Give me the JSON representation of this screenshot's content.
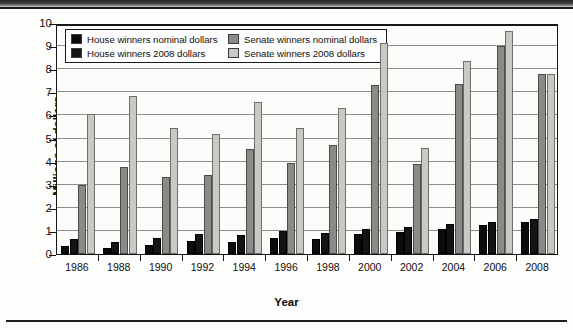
{
  "chart_data": {
    "type": "bar",
    "title": "",
    "xlabel": "Year",
    "ylabel": "Millions of dollars",
    "ylim": [
      0,
      10
    ],
    "ytick_step": 1,
    "yticks": [
      10,
      9,
      8,
      7,
      6,
      5,
      4,
      3,
      2,
      1,
      0
    ],
    "grid": true,
    "legend_position": "inside-top-left",
    "categories": [
      "1986",
      "1988",
      "1990",
      "1992",
      "1994",
      "1996",
      "1998",
      "2000",
      "2002",
      "2004",
      "2006",
      "2008"
    ],
    "series": [
      {
        "name": "House winners nominal dollars",
        "color": "#0c0c0c",
        "values": [
          0.33,
          0.28,
          0.41,
          0.55,
          0.53,
          0.68,
          0.65,
          0.85,
          0.95,
          1.1,
          1.25,
          1.4
        ]
      },
      {
        "name": "House winners 2008 dollars",
        "color": "#141414",
        "values": [
          0.65,
          0.5,
          0.7,
          0.88,
          0.82,
          0.98,
          0.9,
          1.08,
          1.15,
          1.28,
          1.4,
          1.5
        ]
      },
      {
        "name": "Senate winners nominal dollars",
        "color": "#8a8a87",
        "values": [
          3.0,
          3.75,
          3.35,
          3.4,
          4.55,
          3.95,
          4.7,
          7.3,
          3.9,
          7.35,
          9.0,
          7.8
        ]
      },
      {
        "name": "Senate winners 2008 dollars",
        "color": "#c8c8c4",
        "values": [
          6.05,
          6.85,
          5.45,
          5.2,
          6.6,
          5.45,
          6.3,
          9.15,
          4.6,
          8.35,
          9.65,
          7.8
        ]
      }
    ]
  },
  "legend": {
    "items": [
      {
        "label": "House winners nominal dollars",
        "swatch": "#0c0c0c"
      },
      {
        "label": "Senate winners nominal dollars",
        "swatch": "#8a8a87"
      },
      {
        "label": "House winners 2008 dollars",
        "swatch": "#141414"
      },
      {
        "label": "Senate winners 2008 dollars",
        "swatch": "#c8c8c4"
      }
    ]
  }
}
